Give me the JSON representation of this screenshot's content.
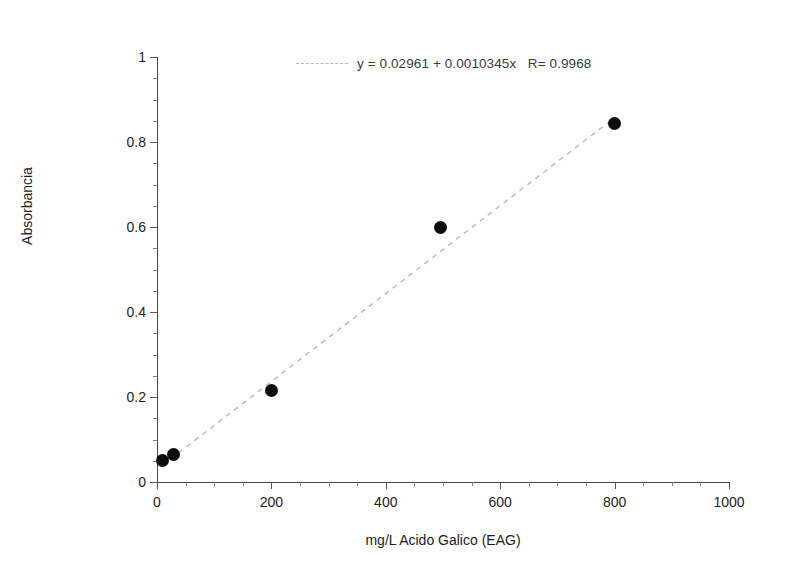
{
  "chart_data": {
    "type": "scatter",
    "title": "",
    "xlabel": "mg/L Acido Galico (EAG)",
    "ylabel": "Absorbancia",
    "xlim": [
      0,
      1000
    ],
    "ylim": [
      0,
      1
    ],
    "grid": false,
    "legend_position": "top-center",
    "x_ticks": [
      0,
      200,
      400,
      600,
      800,
      1000
    ],
    "x_tick_labels": [
      "0",
      "200",
      "400",
      "600",
      "800",
      "1000"
    ],
    "x_minor_tick_step": 50,
    "y_ticks": [
      0,
      0.2,
      0.4,
      0.6,
      0.8,
      1
    ],
    "y_tick_labels": [
      "0",
      "0.2",
      "0.4",
      "0.6",
      "0.8",
      "1"
    ],
    "y_minor_tick_step": 0.05,
    "series": [
      {
        "name": "calibration-points",
        "marker": "filled-circle",
        "color": "#0d0d0d",
        "x": [
          10,
          28,
          200,
          495,
          800
        ],
        "y": [
          0.05,
          0.065,
          0.215,
          0.598,
          0.843
        ]
      }
    ],
    "fit": {
      "name": "linear-fit",
      "style": "dashed",
      "color": "#b9b9b9",
      "intercept": 0.02961,
      "slope": 0.0010345,
      "r": 0.9968,
      "x_start": 10,
      "x_end": 800,
      "annotation": "y = 0.02961 + 0.0010345x   R= 0.9968"
    },
    "annotations": [
      {
        "name": "fit-equation",
        "text": "y = 0.02961 + 0.0010345x   R= 0.9968"
      }
    ]
  },
  "axes": {
    "x_title": "mg/L Acido Galico (EAG)",
    "y_title": "Absorbancia"
  },
  "legend": {
    "equation_text": "y = 0.02961 + 0.0010345x   R= 0.9968"
  }
}
